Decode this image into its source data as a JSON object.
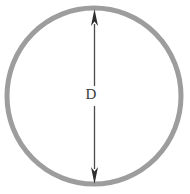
{
  "figure": {
    "name": "circle-diameter-dimension-drawing",
    "background_color": "#ffffff",
    "width": 190,
    "height": 194,
    "circle": {
      "label": "circle-outline",
      "center_x": 94,
      "center_y": 96,
      "radius_x": 87,
      "radius_y": 88,
      "stroke_color": "#9d9d9d",
      "stroke_width": 5,
      "fill": "none"
    },
    "dimension": {
      "label": "D",
      "name": "diameter-dimension",
      "line_color": "#4a4a4a",
      "line_width": 1.2,
      "arrow_color": "#2e2e2e",
      "x": 94,
      "top_y": 9,
      "bottom_y": 184,
      "label_x": 91,
      "label_y": 96,
      "label_gap_top": 86,
      "label_gap_bottom": 106,
      "arrow_head_width": 7,
      "arrow_head_length": 16
    }
  }
}
